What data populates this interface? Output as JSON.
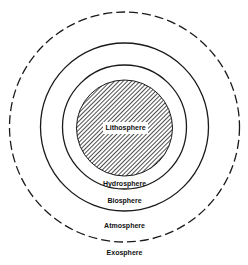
{
  "diagram": {
    "title": "",
    "center": {
      "x": 124.5,
      "y": 127
    },
    "colors": {
      "stroke": "#1a1a1a",
      "hatch": "#222222",
      "background": "#ffffff"
    },
    "layers": [
      {
        "name": "Lithosphere",
        "radius": 48,
        "style": "hatched",
        "label_y": 128
      },
      {
        "name": "Hydrosphere",
        "radius": 62,
        "style": "solid",
        "label_y": 184
      },
      {
        "name": "Biosphere",
        "radius": 84,
        "style": "solid",
        "label_y": 201
      },
      {
        "name": "Atmosphere",
        "radius": 115,
        "style": "dashed",
        "label_y": 226
      },
      {
        "name": "Exosphere",
        "radius": null,
        "style": "none",
        "label_y": 253
      }
    ]
  }
}
